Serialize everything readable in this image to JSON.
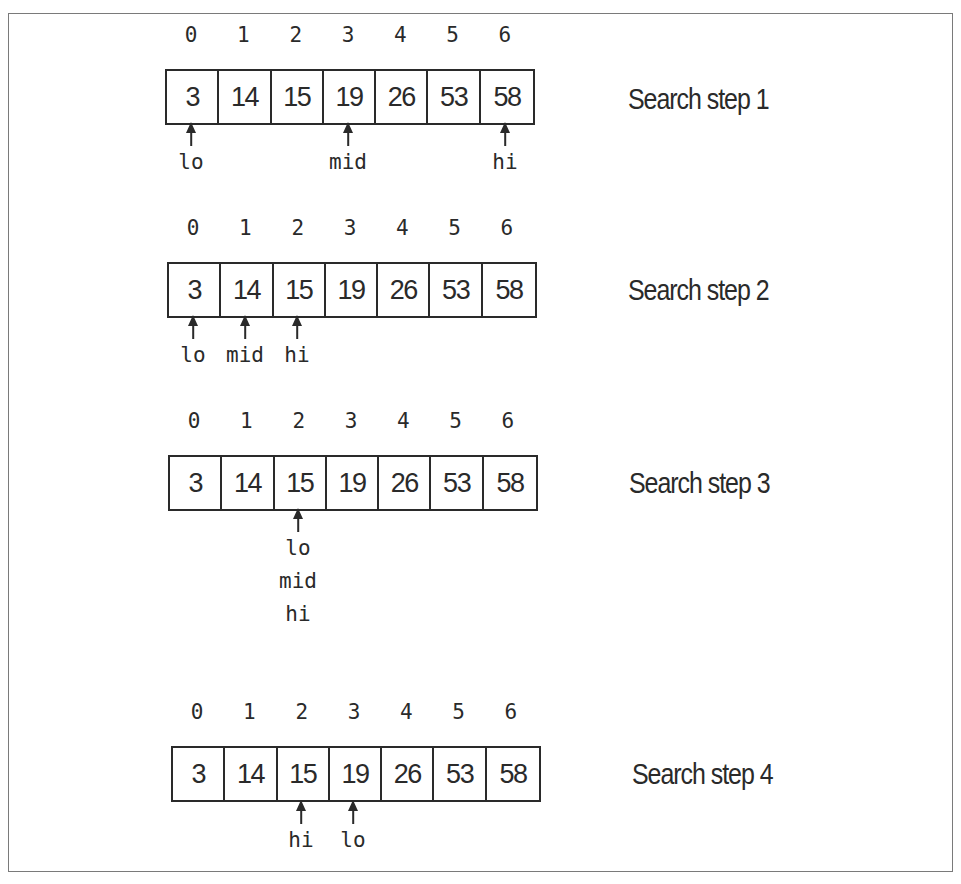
{
  "diagram": {
    "array": [
      3,
      14,
      15,
      19,
      26,
      53,
      58
    ],
    "indices": [
      "0",
      "1",
      "2",
      "3",
      "4",
      "5",
      "6"
    ],
    "steps": [
      {
        "label": "Search step 1",
        "pointers": [
          {
            "index": 0,
            "labels": [
              "lo"
            ]
          },
          {
            "index": 3,
            "labels": [
              "mid"
            ]
          },
          {
            "index": 6,
            "labels": [
              "hi"
            ]
          }
        ]
      },
      {
        "label": "Search step 2",
        "pointers": [
          {
            "index": 0,
            "labels": [
              "lo"
            ]
          },
          {
            "index": 1,
            "labels": [
              "mid"
            ]
          },
          {
            "index": 2,
            "labels": [
              "hi"
            ]
          }
        ]
      },
      {
        "label": "Search step 3",
        "pointers": [
          {
            "index": 2,
            "labels": [
              "lo",
              "mid",
              "hi"
            ]
          }
        ]
      },
      {
        "label": "Search step 4",
        "pointers": [
          {
            "index": 2,
            "labels": [
              "hi"
            ]
          },
          {
            "index": 3,
            "labels": [
              "lo"
            ]
          }
        ]
      }
    ]
  },
  "colors": {
    "ink": "#2a2a2a",
    "frame": "#7a7a7a",
    "background": "#ffffff"
  }
}
